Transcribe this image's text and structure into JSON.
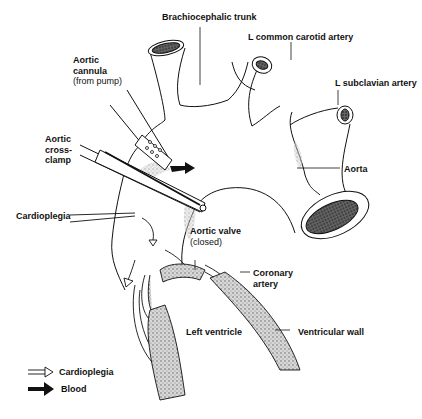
{
  "diagram": {
    "type": "anatomical-illustration",
    "labels": {
      "brachiocephalic": "Brachiocephalic trunk",
      "l_carotid": "L common carotid artery",
      "l_subclavian": "L subclavian artery",
      "aortic_cannula": "Aortic",
      "aortic_cannula_2": "cannula",
      "aortic_cannula_sub": "(from pump)",
      "crossclamp_1": "Aortic",
      "crossclamp_2": "cross-",
      "crossclamp_3": "clamp",
      "aorta": "Aorta",
      "cardioplegia": "Cardioplegia",
      "aortic_valve": "Aortic valve",
      "aortic_valve_sub": "(closed)",
      "coronary_1": "Coronary",
      "coronary_2": "artery",
      "left_ventricle": "Left ventricle",
      "ventricular_wall": "Ventricular wall"
    },
    "legend": [
      {
        "symbol": "hollow-arrow",
        "label": "Cardioplegia"
      },
      {
        "symbol": "solid-arrow",
        "label": "Blood"
      }
    ],
    "colors": {
      "line": "#111111",
      "stipple": "#888888",
      "background": "#ffffff"
    }
  }
}
